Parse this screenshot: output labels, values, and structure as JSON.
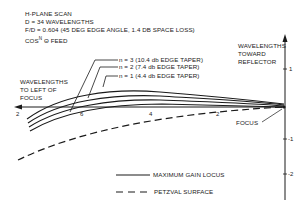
{
  "header": {
    "line1": "H-PLANE SCAN",
    "line2": "D = 34 WAVELENGTHS",
    "line3": "F/D = 0.604 (45 deg EDGE ANGLE, 1.4 db SPACE LOSS)",
    "line4_prefix": "COS",
    "line4_sup": "n",
    "line4_suffix": " θ FEED"
  },
  "axis_labels": {
    "left_line1": "WAVELENGTHS",
    "left_line2": "TO LEFT OF",
    "left_line3": "FOCUS",
    "right_line1": "WAVELENGTHS",
    "right_line2": "TOWARD",
    "right_line3": "REFLECTOR"
  },
  "x_ticks": [
    "2",
    "6",
    "4",
    "2"
  ],
  "y_ticks": [
    "1",
    "-1",
    "-2"
  ],
  "curve_labels": [
    {
      "text": "n = 3 (10.4 db EDGE TAPER)"
    },
    {
      "text": "n = 2 (7.4 db EDGE TAPER)"
    },
    {
      "text": "n = 1 (4.4 db EDGE TAPER)"
    }
  ],
  "annotations": {
    "focus": "FOCUS"
  },
  "legend": {
    "solid": "MAXIMUM GAIN LOCUS",
    "dashed": "PETZVAL SURFACE"
  },
  "colors": {
    "ink": "#1a1a1a",
    "background": "#ffffff"
  }
}
